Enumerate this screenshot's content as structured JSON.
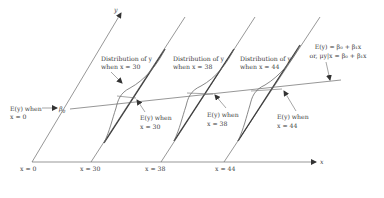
{
  "diagram": {
    "axes": {
      "x_label": "x",
      "y_label": "y"
    },
    "x_positions": [
      {
        "label": "x = 0"
      },
      {
        "label": "x = 30"
      },
      {
        "label": "x = 38"
      },
      {
        "label": "x = 44"
      }
    ],
    "distributions": [
      {
        "line1": "Distribution of y",
        "line2": "when x = 30",
        "mean_line1": "E(y) when",
        "mean_line2": "x = 30"
      },
      {
        "line1": "Distribution of y",
        "line2": "when x = 38",
        "mean_line1": "E(y) when",
        "mean_line2": "x = 38"
      },
      {
        "line1": "Distribution of y",
        "line2": "when x = 44",
        "mean_line1": "E(y) when",
        "mean_line2": "x = 44"
      }
    ],
    "intercept": {
      "line1": "E(y) when",
      "line2": "x = 0",
      "symbol": "β",
      "subscript": "0"
    },
    "regression_equation": {
      "line1": "E(y) = β₀ + β₁x",
      "line2": "or, μy|x = β₀ + β₁x"
    }
  },
  "colors": {
    "line": "#6a6a6a",
    "thick": "#3a3a3a",
    "text": "#3a3a3a"
  }
}
